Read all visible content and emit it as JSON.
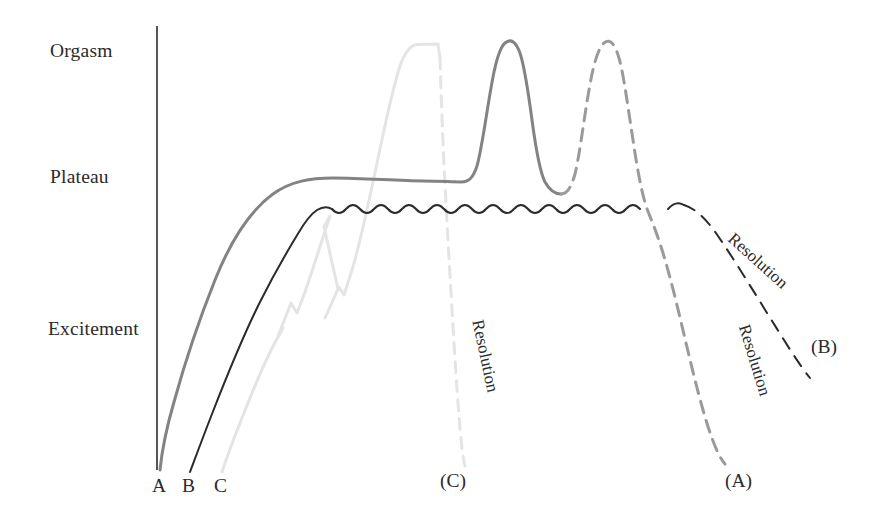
{
  "figure": {
    "type": "line-diagram",
    "background": "#ffffff",
    "axis": {
      "kind": "vertical-only",
      "color": "#2b2b2b",
      "x": 157,
      "y_top": 26,
      "y_bottom": 470
    },
    "y_axis_labels": [
      {
        "text": "Orgasm",
        "x": 50,
        "y": 42,
        "level": "orgasm"
      },
      {
        "text": "Plateau",
        "x": 50,
        "y": 168,
        "level": "plateau"
      },
      {
        "text": "Excitement",
        "x": 48,
        "y": 320,
        "level": "excitement"
      }
    ],
    "x_axis_labels": [
      {
        "text": "A",
        "x": 153,
        "y": 478
      },
      {
        "text": "B",
        "x": 183,
        "y": 478
      },
      {
        "text": "C",
        "x": 215,
        "y": 478
      }
    ],
    "end_labels": [
      {
        "text": "(C)",
        "x": 441,
        "y": 473
      },
      {
        "text": "(A)",
        "x": 726,
        "y": 473
      },
      {
        "text": "(B)",
        "x": 812,
        "y": 338
      }
    ],
    "resolution_labels": [
      {
        "text": "Resolution",
        "x": 487,
        "y": 318,
        "rotate": 78,
        "curve": "C",
        "color": "#3a3a3a"
      },
      {
        "text": "Resolution",
        "x": 752,
        "y": 320,
        "rotate": 73,
        "curve": "A",
        "color": "#3a3a3a"
      },
      {
        "text": "Resolution",
        "x": 737,
        "y": 228,
        "rotate": 42,
        "curve": "B",
        "color": "#3a3a3a"
      }
    ],
    "curves": [
      {
        "id": "A",
        "label": "A",
        "color": "#838383",
        "width": 3.0,
        "description": "Gradual excitement rise to plateau, then two successive orgasms (second dashed), followed by dashed resolution",
        "phases": [
          {
            "name": "excitement-rise",
            "dash": "solid"
          },
          {
            "name": "plateau",
            "dash": "solid"
          },
          {
            "name": "orgasm-1",
            "dash": "solid"
          },
          {
            "name": "orgasm-2",
            "dash": "dashed"
          },
          {
            "name": "resolution",
            "dash": "dashed"
          }
        ],
        "solid_path": "M160,470 C163,452 168,428 175,404 C186,364 200,322 216,282 C232,242 252,212 274,196 C292,183 312,180 334,180 C366,180 398,183 424,183 C442,183 452,184 462,184 C470,184 474,180 478,168 C483,150 487,118 492,90 C496,66 500,50 506,45 C512,40 517,44 521,55 C525,67 529,92 533,122 C537,152 541,174 546,184 C551,193 556,196 562,196",
        "dashed_path": "M562,196 C568,196 572,190 576,176 C581,155 585,120 590,92 C594,68 599,50 605,45 C611,40 616,46 620,60 C625,78 629,110 634,142 C639,176 644,202 650,216 C657,233 663,250 670,276 C680,312 692,370 704,412 C712,440 719,458 726,466",
        "pairs": [
          {
            "x": 160,
            "y": 470
          },
          {
            "x": 216,
            "y": 282
          },
          {
            "x": 274,
            "y": 196
          },
          {
            "x": 334,
            "y": 180
          },
          {
            "x": 462,
            "y": 184
          },
          {
            "x": 506,
            "y": 45
          },
          {
            "x": 562,
            "y": 196
          },
          {
            "x": 605,
            "y": 45
          },
          {
            "x": 650,
            "y": 216
          },
          {
            "x": 726,
            "y": 466
          }
        ]
      },
      {
        "id": "B",
        "label": "B",
        "color": "#2b2b2b",
        "width": 2.0,
        "description": "Later excitement rise to an oscillating plateau (no orgasm), then dashed slow resolution",
        "phases": [
          {
            "name": "excitement-rise",
            "dash": "solid"
          },
          {
            "name": "plateau-wavy",
            "dash": "solid",
            "oscillations": 14
          },
          {
            "name": "resolution",
            "dash": "dashed"
          }
        ],
        "plateau": {
          "y_center": 208,
          "amplitude": 7.5,
          "period": 30,
          "x_start": 282,
          "x_end": 690
        },
        "rise_path": "M190,472 C196,456 203,437 212,414 C226,378 242,338 260,302 C274,274 288,248 300,230 C306,221 312,214 318,211",
        "dashed_path": "M690,203 C700,206 712,216 724,234 C742,260 766,300 790,338 C800,354 808,366 816,376",
        "pairs": [
          {
            "x": 190,
            "y": 472
          },
          {
            "x": 260,
            "y": 302
          },
          {
            "x": 318,
            "y": 211
          },
          {
            "x": 690,
            "y": 203
          },
          {
            "x": 816,
            "y": 376
          }
        ]
      },
      {
        "id": "C",
        "label": "C",
        "color": "#e4e4e4",
        "width": 3.0,
        "description": "Slow stepped (zig-zag) excitement rise, brief plateau, single prolonged orgasm then rapid near-vertical dashed resolution",
        "phases": [
          {
            "name": "excitement-rise-stepped",
            "dash": "solid",
            "steps": 2
          },
          {
            "name": "orgasm-plateau",
            "dash": "solid"
          },
          {
            "name": "resolution",
            "dash": "dashed"
          }
        ],
        "solid_path": "M222,472 C230,452 240,426 252,398 C262,374 272,352 280,336 C284,328 288,322 291,318 L281,335 L292,306 L297,314 L304,294 C312,272 320,248 327,226 C331,214 336,300 336,300 L326,320 L337,288 L342,296 L350,272 C358,246 366,208 374,170 C382,132 390,92 398,68 C403,54 409,46 416,45 L440,44 L441,60",
        "dashed_path": "M441,60 C442,96 444,150 447,206 C450,262 454,330 458,392 C461,432 463,456 465,466",
        "pairs": [
          {
            "x": 222,
            "y": 472
          },
          {
            "x": 291,
            "y": 318
          },
          {
            "x": 350,
            "y": 272
          },
          {
            "x": 416,
            "y": 45
          },
          {
            "x": 441,
            "y": 44
          },
          {
            "x": 465,
            "y": 466
          }
        ]
      }
    ]
  }
}
